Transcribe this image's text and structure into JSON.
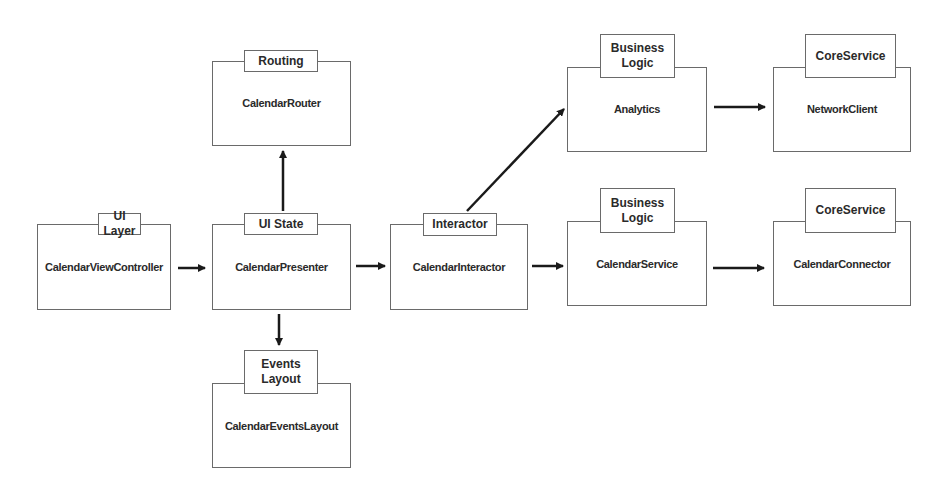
{
  "diagram": {
    "colors": {
      "border": "#6a6a6a",
      "text": "#2a2a2a",
      "arrow": "#1a1a1a",
      "background": "#ffffff"
    },
    "modules": [
      {
        "id": "view_controller",
        "layer": "UI Layer",
        "name": "CalendarViewController"
      },
      {
        "id": "presenter",
        "layer": "UI State",
        "name": "CalendarPresenter"
      },
      {
        "id": "router",
        "layer": "Routing",
        "name": "CalendarRouter"
      },
      {
        "id": "events_layout",
        "layer": "Events\nLayout",
        "name": "CalendarEventsLayout"
      },
      {
        "id": "interactor",
        "layer": "Interactor",
        "name": "CalendarInteractor"
      },
      {
        "id": "analytics",
        "layer": "Business\nLogic",
        "name": "Analytics"
      },
      {
        "id": "network_client",
        "layer": "CoreService",
        "name": "NetworkClient"
      },
      {
        "id": "calendar_service",
        "layer": "Business\nLogic",
        "name": "CalendarService"
      },
      {
        "id": "calendar_connector",
        "layer": "CoreService",
        "name": "CalendarConnector"
      }
    ],
    "edges": [
      {
        "from": "CalendarViewController",
        "to": "CalendarPresenter"
      },
      {
        "from": "CalendarPresenter",
        "to": "CalendarRouter"
      },
      {
        "from": "CalendarPresenter",
        "to": "CalendarEventsLayout"
      },
      {
        "from": "CalendarPresenter",
        "to": "CalendarInteractor"
      },
      {
        "from": "CalendarInteractor",
        "to": "Analytics"
      },
      {
        "from": "CalendarInteractor",
        "to": "CalendarService"
      },
      {
        "from": "Analytics",
        "to": "NetworkClient"
      },
      {
        "from": "CalendarService",
        "to": "CalendarConnector"
      }
    ]
  }
}
